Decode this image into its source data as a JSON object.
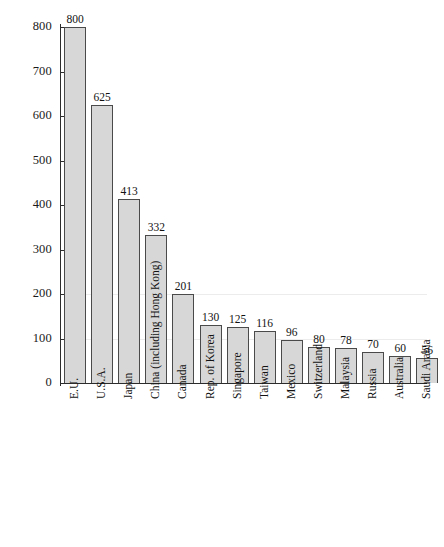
{
  "chart_data": {
    "type": "bar",
    "title": "",
    "xlabel": "",
    "ylabel": "",
    "ylim": [
      0,
      800
    ],
    "yticks": [
      0,
      100,
      200,
      300,
      400,
      500,
      600,
      700,
      800
    ],
    "ytick_labels": [
      "0",
      "100",
      "200",
      "300",
      "400",
      "500",
      "600",
      "700",
      "800"
    ],
    "grid": "faint horizontal gridlines at 100 and 200",
    "legend": "none",
    "orientation": "vertical",
    "bar_color": "#d7d7d7",
    "bar_border_color": "#4a4a4a",
    "axis_color": "#2b2b2b",
    "categories": [
      "E.U.",
      "U.S.A.",
      "Japan",
      "China (including Hong Kong)",
      "Canada",
      "Rep. of Korea",
      "Singapore",
      "Taiwan",
      "Mexico",
      "Switzerland",
      "Malaysia",
      "Russia",
      "Australia",
      "Saudi Arabia"
    ],
    "values": [
      800,
      625,
      413,
      332,
      201,
      130,
      125,
      116,
      96,
      80,
      78,
      70,
      60,
      56
    ],
    "value_labels": [
      "800",
      "625",
      "413",
      "332",
      "201",
      "130",
      "125",
      "116",
      "96",
      "80",
      "78",
      "70",
      "60",
      "56"
    ]
  }
}
